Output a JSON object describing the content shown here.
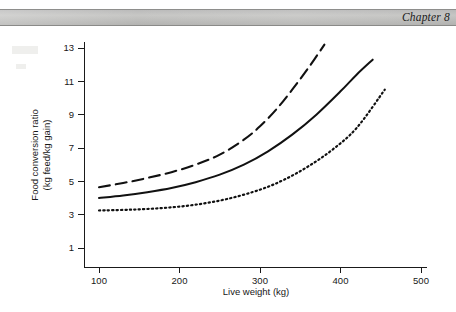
{
  "page": {
    "width": 456,
    "height": 312,
    "background": "#ffffff"
  },
  "header": {
    "chapter_label": "Chapter 8",
    "band_color": "#bdbdbb"
  },
  "chart_data": {
    "type": "line",
    "title": "",
    "xlabel": "Live weight (kg)",
    "ylabel": "Food conversion ratio (kg feed/kg gain)",
    "ylabel_line1": "Food conversion ratio",
    "ylabel_line2": "(kg feed/kg gain)",
    "xlim": [
      85,
      500
    ],
    "ylim": [
      0,
      13.8
    ],
    "xticks": [
      100,
      200,
      300,
      400,
      500
    ],
    "xtick_labels": [
      "100",
      "200",
      "300",
      "400",
      "500"
    ],
    "yticks": [
      1,
      3,
      5,
      7,
      9,
      11,
      13
    ],
    "ytick_labels": [
      "1",
      "3",
      "5",
      "7",
      "9",
      "11",
      "13"
    ],
    "grid": false,
    "legend": "none",
    "line_color": "#111111",
    "series": [
      {
        "name": "upper-curve",
        "style": "dashed",
        "dash_pattern": "11,6",
        "stroke_width": 2.1,
        "x": [
          100,
          130,
          160,
          190,
          220,
          250,
          280,
          300,
          320,
          340,
          360,
          380
        ],
        "values": [
          4.65,
          4.9,
          5.2,
          5.55,
          6.0,
          6.6,
          7.5,
          8.3,
          9.3,
          10.5,
          11.8,
          13.2
        ]
      },
      {
        "name": "middle-curve",
        "style": "solid",
        "dash_pattern": "none",
        "stroke_width": 2.0,
        "x": [
          100,
          130,
          160,
          190,
          220,
          250,
          280,
          310,
          340,
          370,
          400,
          420,
          440
        ],
        "values": [
          4.0,
          4.15,
          4.35,
          4.6,
          4.95,
          5.4,
          6.0,
          6.8,
          7.8,
          9.0,
          10.4,
          11.4,
          12.3
        ]
      },
      {
        "name": "lower-curve",
        "style": "dotted",
        "dash_pattern": "1.3,3.1",
        "stroke_width": 2.2,
        "x": [
          100,
          140,
          180,
          220,
          260,
          300,
          330,
          360,
          390,
          420,
          455
        ],
        "values": [
          3.25,
          3.3,
          3.4,
          3.6,
          3.95,
          4.5,
          5.1,
          5.9,
          6.9,
          8.2,
          10.5
        ]
      }
    ]
  }
}
